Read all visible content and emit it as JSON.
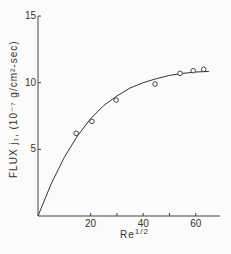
{
  "chart_data": {
    "type": "scatter",
    "title": "",
    "xlabel": "Re",
    "xlabel_sup": "1/2",
    "ylabel": "FLUX j₁, (10⁻⁷ g/cm²-sec)",
    "xlim": [
      0,
      70
    ],
    "ylim": [
      0,
      15
    ],
    "x_ticks": [
      {
        "v": 20,
        "label": "20"
      },
      {
        "v": 30,
        "label": ""
      },
      {
        "v": 40,
        "label": "40"
      },
      {
        "v": 50,
        "label": ""
      },
      {
        "v": 60,
        "label": "60"
      }
    ],
    "y_ticks": [
      {
        "v": 5,
        "label": "5"
      },
      {
        "v": 10,
        "label": "10"
      },
      {
        "v": 15,
        "label": "15"
      }
    ],
    "grid": false,
    "legend": null,
    "series": [
      {
        "name": "measured",
        "marker": "circle",
        "x": [
          14.5,
          20.5,
          29.7,
          44.5,
          54,
          59,
          63
        ],
        "y": [
          6.2,
          7.1,
          8.7,
          9.9,
          10.7,
          10.9,
          11.0
        ]
      },
      {
        "name": "fit curve",
        "marker": "line",
        "x": [
          0,
          5,
          10,
          15,
          20,
          25,
          30,
          35,
          40,
          45,
          50,
          55,
          60,
          65
        ],
        "y": [
          0,
          2.4,
          4.4,
          6.0,
          7.3,
          8.3,
          9.0,
          9.6,
          10.0,
          10.3,
          10.55,
          10.7,
          10.8,
          10.85
        ]
      }
    ]
  }
}
